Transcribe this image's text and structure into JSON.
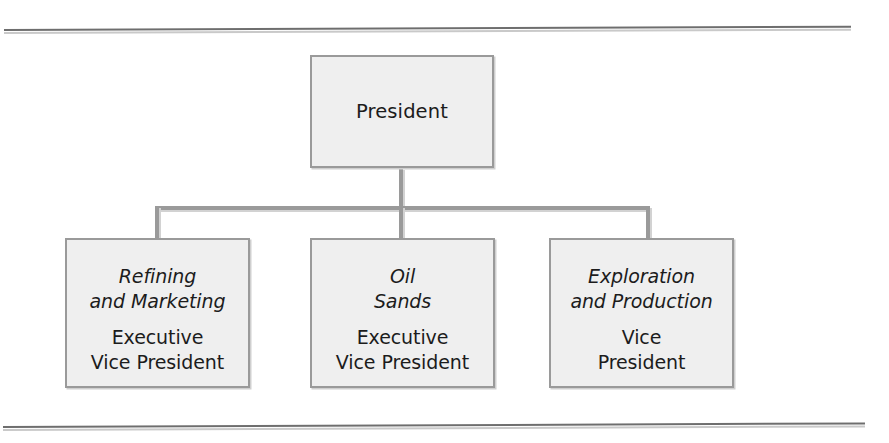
{
  "page": {
    "background_color": "#ffffff",
    "rule_color": "#6e6e6e"
  },
  "chart_data": {
    "type": "diagram",
    "diagram_type": "organization-chart",
    "title": "",
    "orientation": "top-down",
    "node_fill_color": "#efefef",
    "node_border_color": "#9a9a9a",
    "connector_color": "#9a9a9a",
    "text_color": "#1c1c1c",
    "nodes": [
      {
        "id": "president",
        "level": 0,
        "division": "",
        "title": "President",
        "parent": null
      },
      {
        "id": "refining",
        "level": 1,
        "division": "Refining\nand Marketing",
        "title": "Executive\nVice President",
        "parent": "president"
      },
      {
        "id": "oilsands",
        "level": 1,
        "division": "Oil\nSands",
        "title": "Executive\nVice President",
        "parent": "president"
      },
      {
        "id": "exploration",
        "level": 1,
        "division": "Exploration\nand Production",
        "title": "Vice\nPresident",
        "parent": "president"
      }
    ],
    "edges": [
      {
        "from": "president",
        "to": "refining"
      },
      {
        "from": "president",
        "to": "oilsands"
      },
      {
        "from": "president",
        "to": "exploration"
      }
    ]
  }
}
